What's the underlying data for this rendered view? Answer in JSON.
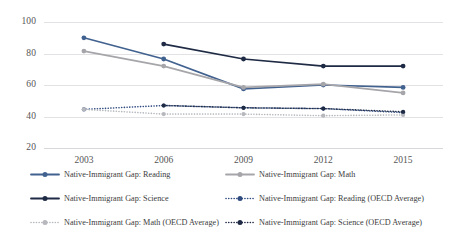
{
  "chart_data": {
    "type": "line",
    "title": "",
    "xlabel": "",
    "ylabel": "",
    "categories": [
      "2003",
      "2006",
      "2009",
      "2012",
      "2015"
    ],
    "yticks": [
      20,
      40,
      60,
      80,
      100
    ],
    "ylim": [
      20,
      100
    ],
    "grid": true,
    "legend_position": "bottom",
    "series": [
      {
        "name": "Native-Immigrant Gap: Reading",
        "values": [
          90,
          76.5,
          57.5,
          60,
          58.5
        ],
        "color": "#41618f",
        "style": "solid"
      },
      {
        "name": "Native-Immigrant Gap: Math",
        "values": [
          81.5,
          72,
          58.5,
          60.5,
          55
        ],
        "color": "#a6a6aa",
        "style": "solid"
      },
      {
        "name": "Native-Immigrant Gap: Science",
        "values": [
          86,
          86,
          76.5,
          72,
          72
        ],
        "color": "#1f2a44",
        "style": "solid",
        "starts_at": "2006"
      },
      {
        "name": "Native-Immigrant Gap: Reading (OECD Average)",
        "values": [
          44.5,
          47,
          45.5,
          45,
          42.5
        ],
        "color": "#2f4b80",
        "style": "dotted"
      },
      {
        "name": "Native-Immigrant Gap: Math (OECD Average)",
        "values": [
          44.5,
          41.5,
          41.5,
          40.5,
          41
        ],
        "color": "#b6b8bd",
        "style": "dotted"
      },
      {
        "name": "Native-Immigrant Gap: Science (OECD Average)",
        "values": [
          44.5,
          47,
          45.5,
          45,
          43
        ],
        "color": "#1f2a44",
        "style": "dotted",
        "starts_at": "2006"
      }
    ]
  },
  "legend": {
    "items": [
      {
        "label": "Native-Immigrant Gap: Reading",
        "color": "#41618f",
        "style": "solid"
      },
      {
        "label": "Native-Immigrant Gap: Math",
        "color": "#a6a6aa",
        "style": "solid"
      },
      {
        "label": "Native-Immigrant Gap: Science",
        "color": "#1f2a44",
        "style": "solid"
      },
      {
        "label": "Native-Immigrant Gap: Reading (OECD Average)",
        "color": "#2f4b80",
        "style": "dotted"
      },
      {
        "label": "Native-Immigrant Gap: Math (OECD Average)",
        "color": "#b6b8bd",
        "style": "dotted"
      },
      {
        "label": "Native-Immigrant Gap: Science (OECD Average)",
        "color": "#1f2a44",
        "style": "dotted"
      }
    ]
  }
}
